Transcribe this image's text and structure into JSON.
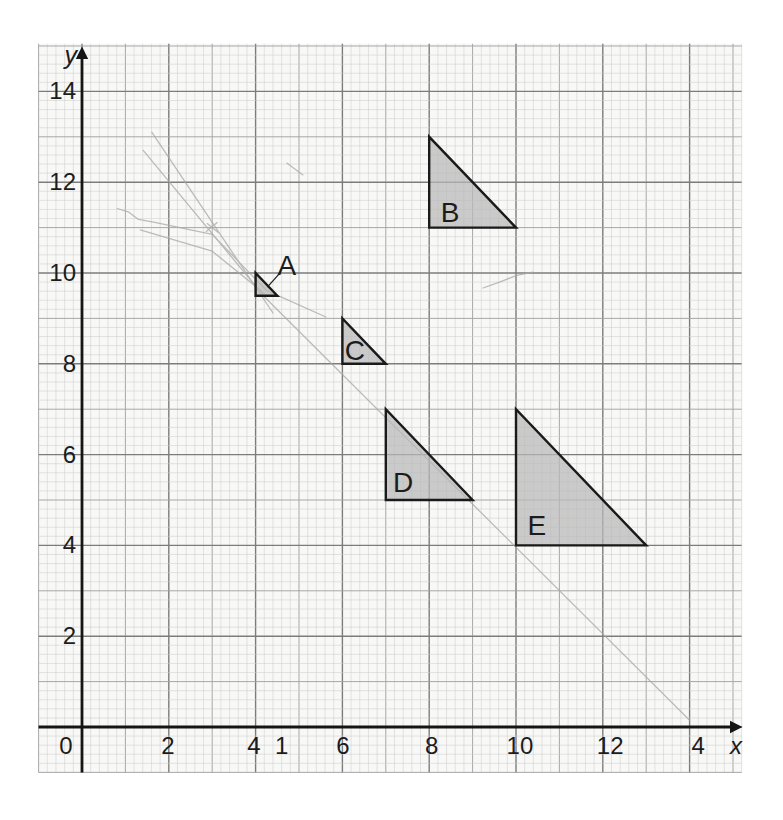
{
  "figure": {
    "description_texts": {
      "triangle_labels": [
        "A",
        "B",
        "C",
        "D",
        "E"
      ]
    },
    "grid": {
      "x_min": -1,
      "x_max": 15.2,
      "y_min": -1,
      "y_max": 15.05,
      "minor_step": 0.2,
      "paper_color": "#f8f8f6",
      "minor_color": "#cecece",
      "unit_color": "#a3a3a3",
      "major_color": "#7c7c7c"
    },
    "axes": {
      "color": "#151515",
      "x_axis_label": "x",
      "y_axis_label": "y",
      "x_ticks": [
        {
          "label": "0",
          "x": -0.37
        },
        {
          "label": "2",
          "x": 1.98
        },
        {
          "label": "4",
          "x": 3.96
        },
        {
          "label": "1",
          "x": 4.6
        },
        {
          "label": "6",
          "x": 6.01
        },
        {
          "label": "8",
          "x": 8.06
        },
        {
          "label": "10",
          "x": 10.09
        },
        {
          "label": "12",
          "x": 12.17
        },
        {
          "label": "4",
          "x": 14.2
        }
      ],
      "y_ticks": [
        {
          "label": "14",
          "y": 14
        },
        {
          "label": "12",
          "y": 12
        },
        {
          "label": "10",
          "y": 10
        },
        {
          "label": "8",
          "y": 8
        },
        {
          "label": "6",
          "y": 6
        },
        {
          "label": "4",
          "y": 4
        },
        {
          "label": "2",
          "y": 2
        }
      ]
    },
    "triangle_style": {
      "fill": "#b9b9b9",
      "fill_opacity": 0.72,
      "stroke": "#1a1a1a",
      "stroke_width": 2.4
    },
    "triangles": [
      {
        "name": "A",
        "vertices": [
          [
            4,
            10
          ],
          [
            4,
            9.5
          ],
          [
            4.5,
            9.5
          ]
        ],
        "label_pos": [
          4.72,
          10.18
        ],
        "leader": [
          [
            4.58,
            10.02
          ],
          [
            4.27,
            9.69
          ]
        ]
      },
      {
        "name": "B",
        "vertices": [
          [
            8,
            13
          ],
          [
            8,
            11
          ],
          [
            10,
            11
          ]
        ],
        "label_pos": [
          8.48,
          11.35
        ]
      },
      {
        "name": "C",
        "vertices": [
          [
            6,
            9
          ],
          [
            6,
            8
          ],
          [
            7,
            8
          ]
        ],
        "label_pos": [
          6.29,
          8.3
        ]
      },
      {
        "name": "D",
        "vertices": [
          [
            7,
            7
          ],
          [
            7,
            5
          ],
          [
            9,
            5
          ]
        ],
        "label_pos": [
          7.4,
          5.4
        ]
      },
      {
        "name": "E",
        "vertices": [
          [
            10,
            7
          ],
          [
            10,
            4
          ],
          [
            13,
            4
          ]
        ],
        "label_pos": [
          10.48,
          4.45
        ]
      }
    ],
    "pencil": {
      "color": "#a8a8a8",
      "opacity": 0.75,
      "lines": [
        [
          [
            1.61,
            13.1
          ],
          [
            4.4,
            9.12
          ]
        ],
        [
          [
            1.41,
            12.7
          ],
          [
            4.22,
            9.46
          ]
        ],
        [
          [
            0.81,
            11.42
          ],
          [
            1.08,
            11.34
          ],
          [
            1.3,
            11.18
          ],
          [
            1.65,
            11.12
          ],
          [
            3.0,
            10.85
          ],
          [
            4.25,
            9.62
          ],
          [
            5.62,
            9.03
          ]
        ],
        [
          [
            1.34,
            10.95
          ],
          [
            3.0,
            10.48
          ],
          [
            4.2,
            9.55
          ]
        ],
        [
          [
            4.22,
            9.46
          ],
          [
            14.0,
            0.15
          ]
        ],
        [
          [
            4.72,
            12.42
          ],
          [
            5.09,
            12.16
          ]
        ],
        [
          [
            9.24,
            9.67
          ],
          [
            9.62,
            9.8
          ],
          [
            10.02,
            9.95
          ],
          [
            10.39,
            10.02
          ]
        ]
      ],
      "cross_mark": {
        "x": 3.0,
        "y": 11.0
      }
    }
  }
}
